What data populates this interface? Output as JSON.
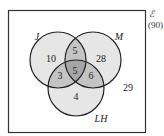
{
  "universe": {
    "symbol": "ℰ",
    "total": "(90)",
    "outside_count": "29"
  },
  "sets": [
    {
      "id": "J",
      "label": "J"
    },
    {
      "id": "M",
      "label": "M"
    },
    {
      "id": "LH",
      "label": "LH"
    }
  ],
  "regions": {
    "J_only": "10",
    "M_only": "28",
    "LH_only": "4",
    "J_M_only": "5",
    "J_LH_only": "3",
    "M_LH_only": "6",
    "J_M_LH": "5"
  },
  "colors": {
    "fill_single": "#e6e6e6",
    "fill_double": "#c4c4c4",
    "fill_triple": "#a6a6a6",
    "stroke": "#222222",
    "box": "#333333"
  }
}
